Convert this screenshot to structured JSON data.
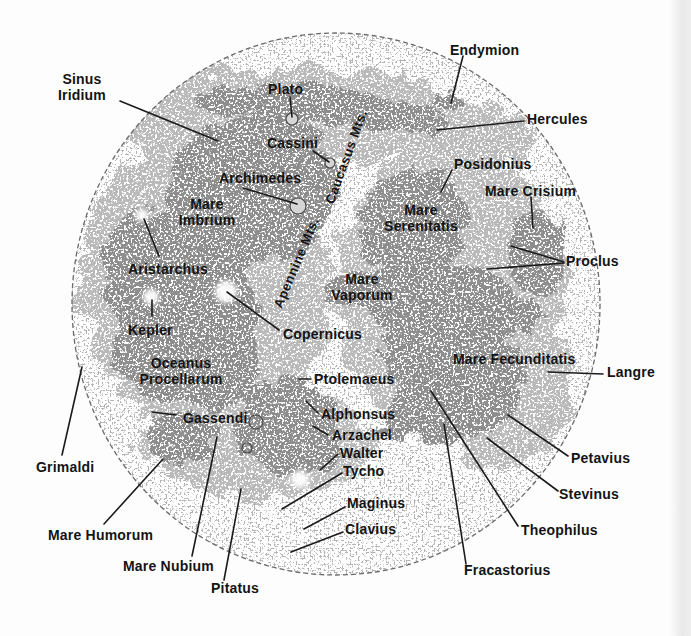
{
  "figure": {
    "type": "annotated-moon-map",
    "colors": {
      "background": "#fdfdfd",
      "mare": "#8d8d8d",
      "midtone": "#b9b9b9",
      "limb_stroke": "#6a6a6a",
      "label_text": "#141414",
      "scan_band": "#e9e9e9"
    }
  },
  "labels": [
    {
      "id": "sinus-iridium",
      "text": "Sinus\nIridium"
    },
    {
      "id": "plato",
      "text": "Plato"
    },
    {
      "id": "endymion",
      "text": "Endymion"
    },
    {
      "id": "hercules",
      "text": "Hercules"
    },
    {
      "id": "cassini",
      "text": "Cassini"
    },
    {
      "id": "archimedes",
      "text": "Archimedes"
    },
    {
      "id": "posidonius",
      "text": "Posidonius"
    },
    {
      "id": "mare-crisium",
      "text": "Mare Crisium"
    },
    {
      "id": "mare-imbrium",
      "text": "Mare\nImbrium"
    },
    {
      "id": "apennine-mts",
      "text": "Apennine Mts."
    },
    {
      "id": "caucasus-mts",
      "text": "Caucasus Mts."
    },
    {
      "id": "mare-serenitatis",
      "text": "Mare\nSerenitatis"
    },
    {
      "id": "aristarchus",
      "text": "Aristarchus"
    },
    {
      "id": "proclus",
      "text": "Proclus"
    },
    {
      "id": "mare-vaporum",
      "text": "Mare\nVaporum"
    },
    {
      "id": "kepler",
      "text": "Kepler"
    },
    {
      "id": "copernicus",
      "text": "Copernicus"
    },
    {
      "id": "oceanus-procellarum",
      "text": "Oceanus\nProcellarum"
    },
    {
      "id": "mare-fecunditatis",
      "text": "Mare Fecunditatis"
    },
    {
      "id": "langrenus",
      "text": "Langre"
    },
    {
      "id": "ptolemaeus",
      "text": "Ptolemaeus"
    },
    {
      "id": "gassendi",
      "text": "Gassendi"
    },
    {
      "id": "alphonsus",
      "text": "Alphonsus"
    },
    {
      "id": "arzachel",
      "text": "Arzachel"
    },
    {
      "id": "walter",
      "text": "Walter"
    },
    {
      "id": "tycho",
      "text": "Tycho"
    },
    {
      "id": "maginus",
      "text": "Maginus"
    },
    {
      "id": "clavius",
      "text": "Clavius"
    },
    {
      "id": "grimaldi",
      "text": "Grimaldi"
    },
    {
      "id": "mare-humorum",
      "text": "Mare Humorum"
    },
    {
      "id": "mare-nubium",
      "text": "Mare Nubium"
    },
    {
      "id": "pitatus",
      "text": "Pitatus"
    },
    {
      "id": "theophilus",
      "text": "Theophilus"
    },
    {
      "id": "fracastorius",
      "text": "Fracastorius"
    },
    {
      "id": "stevinus",
      "text": "Stevinus"
    },
    {
      "id": "petavius",
      "text": "Petavius"
    }
  ]
}
